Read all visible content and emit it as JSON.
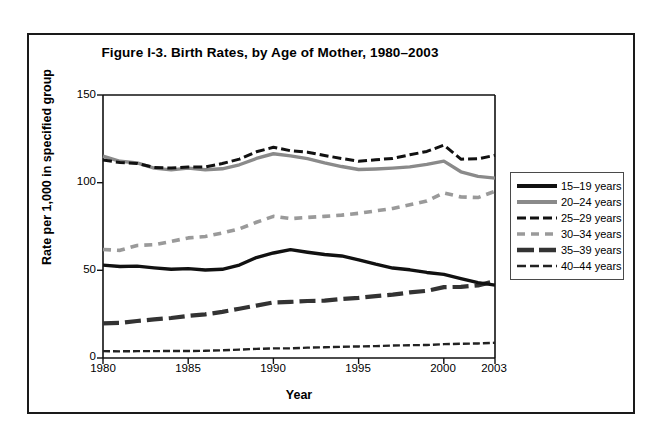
{
  "figure": {
    "title": "Figure I-3. Birth Rates, by Age of Mother, 1980–2003",
    "xlabel": "Year",
    "ylabel": "Rate per 1,000 in specified group"
  },
  "axis": {
    "y_ticks": [
      "0",
      "50",
      "100",
      "150"
    ],
    "x_ticks": [
      "1980",
      "1985",
      "1990",
      "1995",
      "2000",
      "2003"
    ]
  },
  "legend": {
    "items": [
      {
        "label": "15–19 years",
        "style": "solid-black-thick",
        "color": "#111111"
      },
      {
        "label": "20–24 years",
        "style": "solid-gray-thick",
        "color": "#8a8a8a"
      },
      {
        "label": "25–29 years",
        "style": "dash-black",
        "color": "#111111"
      },
      {
        "label": "30–34 years",
        "style": "dash-gray",
        "color": "#9a9a9a"
      },
      {
        "label": "35–39 years",
        "style": "longdash-black-thick",
        "color": "#333333"
      },
      {
        "label": "40–44 years",
        "style": "dashdot-black-thin",
        "color": "#222222"
      }
    ]
  },
  "chart_data": {
    "type": "line",
    "title": "Figure I-3. Birth Rates, by Age of Mother, 1980–2003",
    "xlabel": "Year",
    "ylabel": "Rate per 1,000 in specified group",
    "xlim": [
      1980,
      2003
    ],
    "ylim": [
      0,
      150
    ],
    "yticks": [
      0,
      50,
      100,
      150
    ],
    "xticks": [
      1980,
      1985,
      1990,
      1995,
      2000,
      2003
    ],
    "grid": false,
    "legend_position": "right-outside",
    "x": [
      1980,
      1981,
      1982,
      1983,
      1984,
      1985,
      1986,
      1987,
      1988,
      1989,
      1990,
      1991,
      1992,
      1993,
      1994,
      1995,
      1996,
      1997,
      1998,
      1999,
      2000,
      2001,
      2002,
      2003
    ],
    "series": [
      {
        "name": "15–19 years",
        "color": "#111111",
        "values": [
          53.0,
          52.2,
          52.4,
          51.4,
          50.6,
          51.0,
          50.2,
          50.6,
          53.0,
          57.3,
          59.9,
          61.8,
          60.3,
          59.0,
          58.2,
          56.0,
          53.5,
          51.3,
          50.3,
          48.8,
          47.7,
          45.3,
          43.0,
          41.6
        ]
      },
      {
        "name": "20–24 years",
        "color": "#8a8a8a",
        "values": [
          115.1,
          112.2,
          111.3,
          108.3,
          107.3,
          108.3,
          107.4,
          107.9,
          110.2,
          113.8,
          116.5,
          115.3,
          113.7,
          111.3,
          109.2,
          107.5,
          107.8,
          108.3,
          109.0,
          110.4,
          112.3,
          106.2,
          103.6,
          102.6
        ]
      },
      {
        "name": "25–29 years",
        "color": "#111111",
        "values": [
          112.9,
          111.5,
          111.0,
          108.7,
          108.3,
          108.9,
          109.0,
          110.9,
          113.4,
          117.6,
          120.2,
          118.2,
          117.4,
          115.5,
          113.8,
          112.2,
          113.1,
          113.8,
          115.9,
          117.8,
          121.4,
          113.4,
          113.6,
          115.6
        ]
      },
      {
        "name": "30–34 years",
        "color": "#9a9a9a",
        "values": [
          61.9,
          61.4,
          64.2,
          64.6,
          66.5,
          68.5,
          69.3,
          71.3,
          73.7,
          77.4,
          80.8,
          79.5,
          80.2,
          80.8,
          81.5,
          82.5,
          83.9,
          85.3,
          87.4,
          89.6,
          94.1,
          91.9,
          91.5,
          95.1
        ]
      },
      {
        "name": "35–39 years",
        "color": "#333333",
        "values": [
          19.8,
          20.0,
          21.1,
          22.0,
          22.8,
          24.0,
          24.9,
          26.3,
          28.1,
          29.9,
          31.7,
          32.0,
          32.5,
          32.7,
          33.7,
          34.3,
          35.3,
          36.1,
          37.4,
          38.3,
          40.4,
          40.6,
          41.4,
          43.8
        ]
      },
      {
        "name": "40–44 years",
        "color": "#222222",
        "values": [
          3.9,
          3.8,
          3.9,
          3.9,
          4.0,
          4.0,
          4.1,
          4.4,
          4.8,
          5.2,
          5.5,
          5.5,
          5.9,
          6.1,
          6.4,
          6.6,
          6.8,
          7.1,
          7.3,
          7.4,
          7.9,
          8.1,
          8.3,
          8.7
        ]
      }
    ]
  }
}
